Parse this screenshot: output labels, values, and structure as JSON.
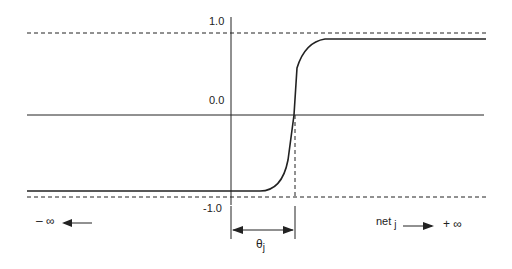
{
  "figure": {
    "type": "sigmoid threshold activation function diagram",
    "y_labels": {
      "top": "1.0",
      "zero": "0.0",
      "bottom": "-1.0"
    },
    "threshold_label": {
      "symbol": "θ",
      "subscript": "j"
    },
    "x_left_label": "– ∞",
    "x_right_label": {
      "text": "net",
      "subscript": "j",
      "infinity": "+ ∞"
    },
    "colors": {
      "line": "#222222",
      "background": "#ffffff"
    }
  }
}
